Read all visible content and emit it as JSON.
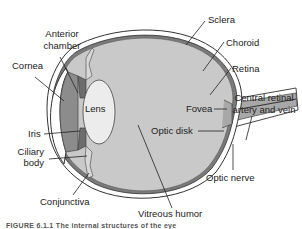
{
  "diagram": {
    "type": "anatomical-cross-section",
    "labels": {
      "sclera": "Sclera",
      "choroid": "Choroid",
      "retina": "Retina",
      "anterior_chamber_1": "Anterior",
      "anterior_chamber_2": "chamber",
      "cornea": "Cornea",
      "lens": "Lens",
      "fovea": "Fovea",
      "central_retinal_1": "Central retinal",
      "central_retinal_2": "artery and vein",
      "optic_disk": "Optic disk",
      "iris": "Iris",
      "ciliary_body_1": "Ciliary",
      "ciliary_body_2": "body",
      "optic_nerve": "Optic nerve",
      "conjunctiva": "Conjunctiva",
      "vitreous_humor": "Vitreous humor"
    },
    "caption": "FIGURE 6.1.1  The internal structures of the eye",
    "colors": {
      "background": "#ffffff",
      "vitreous": "#c9c9c9",
      "anterior_chamber": "#8c8c8c",
      "lens": "#ececec",
      "sclera": "#ffffff",
      "outline": "#333333",
      "optic_nerve": "#a8a8a8"
    }
  }
}
